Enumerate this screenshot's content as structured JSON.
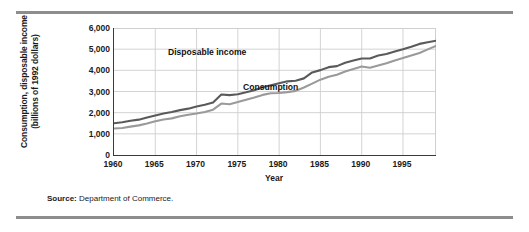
{
  "figure": {
    "source_label": "Source:",
    "source_text": "Department of Commerce."
  },
  "chart_data": {
    "type": "line",
    "title": "",
    "subtitle": "",
    "xlabel": "Year",
    "ylabel": "Consumption, disposable income (billions of 1992 dollars)",
    "ylabel_line1": "Consumption, disposable income",
    "ylabel_line2": "(billions of 1992 dollars)",
    "xlim": [
      1960,
      1999
    ],
    "ylim": [
      0,
      6000
    ],
    "grid": true,
    "legend_position": "in-plot-annotations",
    "y_ticks": [
      0,
      1000,
      2000,
      3000,
      4000,
      5000,
      6000
    ],
    "y_tick_labels": [
      "0",
      "1,000",
      "2,000",
      "3,000",
      "4,000",
      "5,000",
      "6,000"
    ],
    "x_ticks": [
      1960,
      1965,
      1970,
      1975,
      1980,
      1985,
      1990,
      1995
    ],
    "x_tick_labels": [
      "1960",
      "1965",
      "1970",
      "1975",
      "1980",
      "1985",
      "1990",
      "1995"
    ],
    "x": [
      1960,
      1961,
      1962,
      1963,
      1964,
      1965,
      1966,
      1967,
      1968,
      1969,
      1970,
      1971,
      1972,
      1973,
      1974,
      1975,
      1976,
      1977,
      1978,
      1979,
      1980,
      1981,
      1982,
      1983,
      1984,
      1985,
      1986,
      1987,
      1988,
      1989,
      1990,
      1991,
      1992,
      1993,
      1994,
      1995,
      1996,
      1997,
      1998,
      1999
    ],
    "series": [
      {
        "name": "Disposable income",
        "color": "#5a5a5a",
        "values": [
          1500,
          1545,
          1615,
          1670,
          1775,
          1870,
          1960,
          2035,
          2120,
          2190,
          2290,
          2375,
          2480,
          2860,
          2830,
          2870,
          2960,
          3060,
          3200,
          3300,
          3390,
          3480,
          3510,
          3620,
          3900,
          4010,
          4150,
          4200,
          4360,
          4460,
          4560,
          4560,
          4700,
          4770,
          4890,
          5000,
          5120,
          5250,
          5330,
          5400
        ]
      },
      {
        "name": "Consumption",
        "color": "#9a9a9a",
        "values": [
          1250,
          1275,
          1340,
          1400,
          1490,
          1590,
          1680,
          1730,
          1830,
          1900,
          1960,
          2030,
          2140,
          2430,
          2400,
          2500,
          2610,
          2720,
          2840,
          2920,
          2930,
          2970,
          3030,
          3190,
          3370,
          3560,
          3700,
          3790,
          3940,
          4060,
          4180,
          4120,
          4230,
          4340,
          4470,
          4580,
          4700,
          4820,
          4990,
          5150
        ]
      }
    ],
    "annotations": [
      {
        "text": "Disposable income",
        "series": "Disposable income"
      },
      {
        "text": "Consumption",
        "series": "Consumption"
      }
    ]
  }
}
